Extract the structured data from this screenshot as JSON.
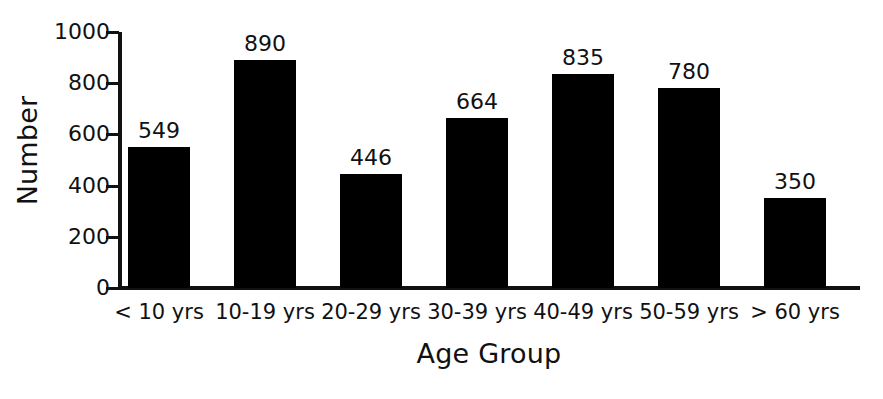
{
  "chart_data": {
    "type": "bar",
    "title": "",
    "xlabel": "Age Group",
    "ylabel": "Number",
    "categories": [
      "< 10 yrs",
      "10-19 yrs",
      "20-29 yrs",
      "30-39 yrs",
      "40-49 yrs",
      "50-59 yrs",
      "> 60 yrs"
    ],
    "values": [
      549,
      890,
      446,
      664,
      835,
      780,
      350
    ],
    "data_labels": [
      "549",
      "890",
      "446",
      "664",
      "835",
      "780",
      "350"
    ],
    "ylim": [
      0,
      1000
    ],
    "yticks": [
      0,
      200,
      400,
      600,
      800,
      1000
    ],
    "ytick_labels": [
      "0",
      "200",
      "400",
      "600",
      "800",
      "1000"
    ],
    "grid": false,
    "legend": false,
    "bar_color": "#000000",
    "axis_color": "#111111",
    "background_color": "#ffffff"
  },
  "axes": {
    "y_title": "Number",
    "x_title": "Age Group"
  }
}
